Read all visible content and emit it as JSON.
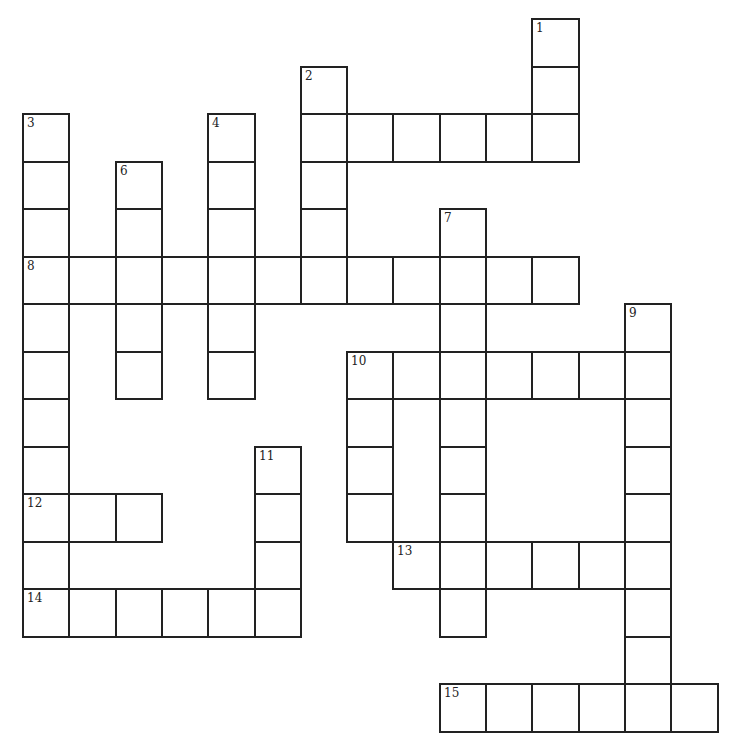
{
  "puzzle": {
    "type": "crossword",
    "cell_color": "#ffffff",
    "line_color": "#222222",
    "background": "#ffffff",
    "grid": {
      "origin_x": 23,
      "origin_y": 19,
      "cell_w": 46.3,
      "cell_h": 47.5
    },
    "cells": [
      {
        "r": 0,
        "c": 11,
        "num": "1"
      },
      {
        "r": 1,
        "c": 11
      },
      {
        "r": 1,
        "c": 6,
        "num": "2"
      },
      {
        "r": 2,
        "c": 6
      },
      {
        "r": 2,
        "c": 7
      },
      {
        "r": 2,
        "c": 8
      },
      {
        "r": 2,
        "c": 9
      },
      {
        "r": 2,
        "c": 10
      },
      {
        "r": 2,
        "c": 11
      },
      {
        "r": 2,
        "c": 0,
        "num": "3"
      },
      {
        "r": 2,
        "c": 4,
        "num": "4"
      },
      {
        "r": 3,
        "c": 0
      },
      {
        "r": 3,
        "c": 2,
        "num": "6"
      },
      {
        "r": 3,
        "c": 4
      },
      {
        "r": 3,
        "c": 6
      },
      {
        "r": 4,
        "c": 0
      },
      {
        "r": 4,
        "c": 2
      },
      {
        "r": 4,
        "c": 4
      },
      {
        "r": 4,
        "c": 6
      },
      {
        "r": 4,
        "c": 9,
        "num": "7"
      },
      {
        "r": 5,
        "c": 0,
        "num": "8"
      },
      {
        "r": 5,
        "c": 1
      },
      {
        "r": 5,
        "c": 2
      },
      {
        "r": 5,
        "c": 3
      },
      {
        "r": 5,
        "c": 4
      },
      {
        "r": 5,
        "c": 5
      },
      {
        "r": 5,
        "c": 6
      },
      {
        "r": 5,
        "c": 7
      },
      {
        "r": 5,
        "c": 8
      },
      {
        "r": 5,
        "c": 9
      },
      {
        "r": 5,
        "c": 10
      },
      {
        "r": 5,
        "c": 11
      },
      {
        "r": 6,
        "c": 0
      },
      {
        "r": 6,
        "c": 2
      },
      {
        "r": 6,
        "c": 4
      },
      {
        "r": 6,
        "c": 9
      },
      {
        "r": 6,
        "c": 13,
        "num": "9"
      },
      {
        "r": 7,
        "c": 0
      },
      {
        "r": 7,
        "c": 2
      },
      {
        "r": 7,
        "c": 4
      },
      {
        "r": 7,
        "c": 7,
        "num": "10"
      },
      {
        "r": 7,
        "c": 8
      },
      {
        "r": 7,
        "c": 9
      },
      {
        "r": 7,
        "c": 10
      },
      {
        "r": 7,
        "c": 11
      },
      {
        "r": 7,
        "c": 12
      },
      {
        "r": 7,
        "c": 13
      },
      {
        "r": 8,
        "c": 0
      },
      {
        "r": 8,
        "c": 7
      },
      {
        "r": 8,
        "c": 9
      },
      {
        "r": 8,
        "c": 13
      },
      {
        "r": 9,
        "c": 0
      },
      {
        "r": 9,
        "c": 5,
        "num": "11"
      },
      {
        "r": 9,
        "c": 7
      },
      {
        "r": 9,
        "c": 9
      },
      {
        "r": 9,
        "c": 13
      },
      {
        "r": 10,
        "c": 0,
        "num": "12"
      },
      {
        "r": 10,
        "c": 1
      },
      {
        "r": 10,
        "c": 2
      },
      {
        "r": 10,
        "c": 5
      },
      {
        "r": 10,
        "c": 7
      },
      {
        "r": 10,
        "c": 9
      },
      {
        "r": 10,
        "c": 13
      },
      {
        "r": 11,
        "c": 0
      },
      {
        "r": 11,
        "c": 5
      },
      {
        "r": 11,
        "c": 8,
        "num": "13"
      },
      {
        "r": 11,
        "c": 9
      },
      {
        "r": 11,
        "c": 10
      },
      {
        "r": 11,
        "c": 11
      },
      {
        "r": 11,
        "c": 12
      },
      {
        "r": 11,
        "c": 13
      },
      {
        "r": 12,
        "c": 0,
        "num": "14"
      },
      {
        "r": 12,
        "c": 1
      },
      {
        "r": 12,
        "c": 2
      },
      {
        "r": 12,
        "c": 3
      },
      {
        "r": 12,
        "c": 4
      },
      {
        "r": 12,
        "c": 5
      },
      {
        "r": 12,
        "c": 9
      },
      {
        "r": 12,
        "c": 13
      },
      {
        "r": 13,
        "c": 13
      },
      {
        "r": 14,
        "c": 9,
        "num": "15"
      },
      {
        "r": 14,
        "c": 10
      },
      {
        "r": 14,
        "c": 11
      },
      {
        "r": 14,
        "c": 12
      },
      {
        "r": 14,
        "c": 13
      },
      {
        "r": 14,
        "c": 14
      }
    ],
    "clue_numbers": [
      "1",
      "2",
      "3",
      "4",
      "6",
      "7",
      "8",
      "9",
      "10",
      "11",
      "12",
      "13",
      "14",
      "15"
    ]
  }
}
